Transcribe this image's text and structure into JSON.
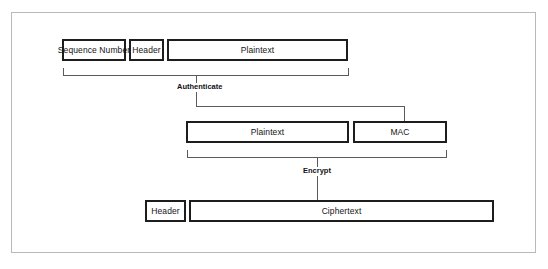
{
  "figure": {
    "caption": ""
  },
  "rows": {
    "row1": {
      "label": "Pre-protection record",
      "blocks": [
        {
          "label": "Sequence Number",
          "name": "sequence-number-block"
        },
        {
          "label": "Header",
          "name": "header-block-row1"
        },
        {
          "label": "Plaintext",
          "name": "plaintext-block-row1"
        }
      ]
    },
    "row2": {
      "label": "Authenticated record",
      "blocks": [
        {
          "label": "Plaintext",
          "name": "plaintext-block-row2"
        },
        {
          "label": "MAC",
          "name": "mac-block"
        }
      ]
    },
    "row3": {
      "label": "Encrypted record",
      "blocks": [
        {
          "label": "Header",
          "name": "header-block-row3"
        },
        {
          "label": "Ciphertext",
          "name": "ciphertext-block"
        }
      ]
    }
  },
  "steps": [
    {
      "label": "Authenticate",
      "name": "authenticate-step-label"
    },
    {
      "label": "Encrypt",
      "name": "encrypt-step-label"
    }
  ],
  "colors": {
    "block_border": "#1d1d1d",
    "connector": "#5b5b5b",
    "frame": "#b9b9b9",
    "text": "#141414",
    "background": "#ffffff"
  }
}
